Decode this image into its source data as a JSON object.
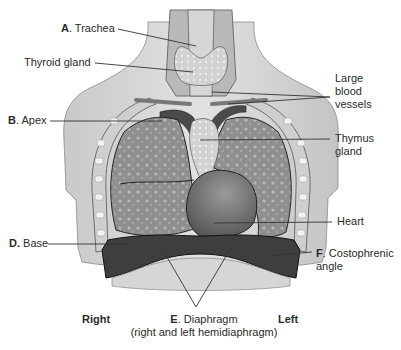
{
  "figure": {
    "colors": {
      "background": "#ffffff",
      "body_skin": "#d9d9d9",
      "body_shadow": "#bcbcbc",
      "lung": "#8e8e8e",
      "lung_texture": "#b3b3b3",
      "heart": "#6e6e6e",
      "diaphragm": "#3e3e3e",
      "rib": "#eeeeee",
      "leader_line": "#333333"
    }
  },
  "labels": {
    "trachea": {
      "letter": "A",
      "text": ". Trachea"
    },
    "thyroid": {
      "text": "Thyroid gland"
    },
    "vessels": {
      "line1": "Large",
      "line2": "blood",
      "line3": "vessels"
    },
    "apex": {
      "letter": "B",
      "text": ". Apex"
    },
    "thymus": {
      "line1": "Thymus",
      "line2": "gland"
    },
    "heart": {
      "text": "Heart"
    },
    "base": {
      "letter": "D.",
      "text": " Base"
    },
    "costophrenic": {
      "letter": "F",
      "text": ". Costophrenic",
      "line2": "angle"
    },
    "diaphragm": {
      "letter": "E",
      "text": ". Diaphragm",
      "line2": "(right and left hemidiaphragm)"
    },
    "right": "Right",
    "left": "Left"
  }
}
